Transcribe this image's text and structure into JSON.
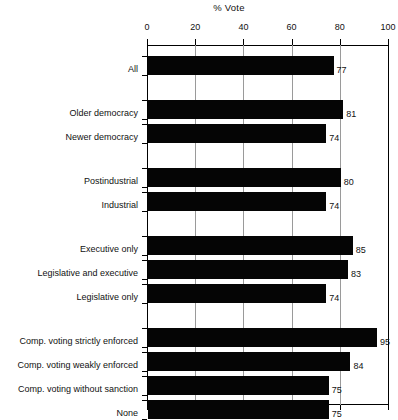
{
  "chart_data": {
    "type": "bar",
    "orientation": "horizontal",
    "title": "% Vote",
    "xlabel": "",
    "ylabel": "",
    "xlim": [
      0,
      100
    ],
    "xticks": [
      0,
      20,
      40,
      60,
      80,
      100
    ],
    "xtick_labels": [
      "0",
      "20",
      "40",
      "60",
      "80",
      "100"
    ],
    "grid": true,
    "legend": false,
    "bar_color": "#050505",
    "gridline_color": "#9a9a9a",
    "axis_color": "#000000",
    "categories": [
      "All",
      "Older democracy",
      "Newer democracy",
      "Postindustrial",
      "Industrial",
      "Executive only",
      "Legislative and executive",
      "Legislative only",
      "Comp. voting strictly enforced",
      "Comp. voting weakly enforced",
      "Comp. voting without sanction",
      "None"
    ],
    "values": [
      77,
      81,
      74,
      80,
      74,
      85,
      83,
      74,
      95,
      84,
      75,
      75
    ],
    "value_labels": [
      "77",
      "81",
      "74",
      "80",
      "74",
      "85",
      "83",
      "74",
      "95",
      "84",
      "75",
      "75"
    ],
    "groups": [
      {
        "name": "overall",
        "categories": [
          "All"
        ]
      },
      {
        "name": "democracy-age",
        "categories": [
          "Older democracy",
          "Newer democracy"
        ]
      },
      {
        "name": "economy-type",
        "categories": [
          "Postindustrial",
          "Industrial"
        ]
      },
      {
        "name": "branch-elected",
        "categories": [
          "Executive only",
          "Legislative and executive",
          "Legislative only"
        ]
      },
      {
        "name": "compulsory-voting",
        "categories": [
          "Comp. voting strictly enforced",
          "Comp. voting weakly enforced",
          "Comp. voting without sanction",
          "None"
        ]
      }
    ]
  },
  "bars": [
    {
      "label": "All",
      "value": 77,
      "value_label": "77",
      "top": 11,
      "height": 19
    },
    {
      "label": "Older democracy",
      "value": 81,
      "value_label": "81",
      "top": 55,
      "height": 19
    },
    {
      "label": "Newer democracy",
      "value": 74,
      "value_label": "74",
      "top": 79,
      "height": 19
    },
    {
      "label": "Postindustrial",
      "value": 80,
      "value_label": "80",
      "top": 123,
      "height": 19
    },
    {
      "label": "Industrial",
      "value": 74,
      "value_label": "74",
      "top": 147,
      "height": 19
    },
    {
      "label": "Executive only",
      "value": 85,
      "value_label": "85",
      "top": 191,
      "height": 19
    },
    {
      "label": "Legislative and executive",
      "value": 83,
      "value_label": "83",
      "top": 215,
      "height": 19
    },
    {
      "label": "Legislative only",
      "value": 74,
      "value_label": "74",
      "top": 239,
      "height": 19
    },
    {
      "label": "Comp. voting strictly enforced",
      "value": 95,
      "value_label": "95",
      "top": 283,
      "height": 19
    },
    {
      "label": "Comp. voting weakly enforced",
      "value": 84,
      "value_label": "84",
      "top": 307,
      "height": 19
    },
    {
      "label": "Comp. voting without sanction",
      "value": 75,
      "value_label": "75",
      "top": 331,
      "height": 19
    },
    {
      "label": "None",
      "value": 75,
      "value_label": "75",
      "top": 355,
      "height": 19
    }
  ],
  "axis": {
    "title": "% Vote",
    "ticks": [
      {
        "label": "0",
        "value": 0
      },
      {
        "label": "20",
        "value": 20
      },
      {
        "label": "40",
        "value": 40
      },
      {
        "label": "60",
        "value": 60
      },
      {
        "label": "80",
        "value": 80
      },
      {
        "label": "100",
        "value": 100
      }
    ]
  }
}
